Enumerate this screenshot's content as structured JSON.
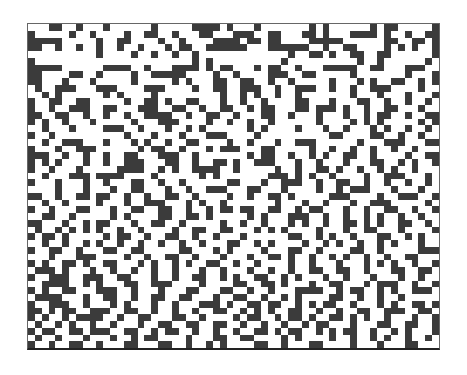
{
  "image": {
    "description": "Abstract noisy binary pixel grid inside a thin frame",
    "colors": {
      "dark": "#3b3b3b",
      "light": "#e9e9e9",
      "background": "#ffffff",
      "frame": "#666666"
    },
    "columns": 60,
    "rows_count": 48,
    "rows": [
      "...##..#...#......#.....####.#...#.......#.#......#.##.....#",
      "#.....#..#....#..##..#...##...###..##...##.#...####.#..#..##",
      "#####.....#..##....#..#....####.##.##....#####......##..##.#",
      "##..#..#..#..#..#...#.##..######...######..#..##....#.#.#..#",
      "..........#....#..#..#..#.............#..##.#..##..##......#",
      "#.......................#.#..........#..........#..#......#.",
      "#####......####..#...####.#.##...#.##..#...#####..##...###..",
      "##....##..#....#..#####....#..#....###..##.....#.......#...#",
      "##...#...#.....#.....#.#...##..##..#..#.....#...#.#..##..#.#",
      ".#..###...###....###....#..##..###..#..###..#..#..###....#..",
      "..#.#......#.#....#.........#..#.#..#..#.......#...#...#...#",
      "#..##..##.....#..##.#..##...#..#..#....##...#...##..#..#..#.",
      "#..#..###..##...###..##..#..##..#.##...##.###.#..#..##...#..",
      "##..##..#..#..#..####..#..##..#...##..#...#...#..#.##..#..##",
      "#.#..#...#.....#...###....#..#..#..#......#....#.#.#.....#.#",
      "..#...#....###..#...#..#.#......#.#....#...#..#...#.#..#..#.",
      "#..#..........#...#...#...###....#..........##....##..#..#..",
      "..#..###...#...#.#..#..##....#..#...#..###......#...###...##",
      "#...#..###......#.##..#...#.###...##.....#..#..#..#..#..#...",
      "###..#..#..#..##...###..#.......#.##..#..#.#..##..#....#..##",
      "#.#.#...#..#..###...##..#..##.#..###...#..#...#...##..#.#..#",
      "#..#...#.....####..#.#..####..#.....#..#..##.#..#..#.#..#...",
      "..#...###.####....#......#.#.......###.#.#..#....#..###...#.",
      "#...#...#..#...##..#..#......##...#..###..#..##..#..#..#..#.",
      "....#...#...#..##...#..#..###...##...#....#..#.###...#...#..",
      "##..#..##.##..#..#..##..#....#..#..##.#.....###....#..###..#",
      "..#..#....#...#..###...#.#..#.......#...#..#...#..###.....#.",
      "#..#...##...#..##..##..#..#.##.##..##..#.##...#..#..##..#..#",
      "..##..#.....#.#....##..##.#.....#.#...###..#..#..#.#..#..#..",
      "##...#..#.##...#..##..#.....#..#..#...#.#..#..##.#.#..##..#.",
      ".#..#.#.#.#..#..#....#..##..##...#.#.#....#...#..##...#....#",
      "#.##.#.....#.##..#..##..#..#...#......##..#.#..#...##..#.#..",
      "..#..#..#.#..#..#..#..#..#...##..#.#....#..#.#..#..#.#...#..",
      "#..##..#...##..##.....##...#.#....#...##..#....##..#.....###",
      "...#...###....#..#..##..#...#...#..##.#..#..#.#..#..#..##...",
      "#.#..##.#..##...#.#..#.#..##..#..#....#..#...#...#.#.#..#..#",
      ".###.#...#..#..#..#..#...#..#...#..#..#..##..##..#...##..##.",
      "#..###..###..##...#..#..##..#.#..##..#.#...#..#...#...#..#..",
      "..####..#.#...##..###....#....##..##.#...#..##...#.###..#..#",
      "#.#..##...###..#...#...##...##..#..#...####..#.##..#.#..###.",
      ".####...#..##..#..##..##...#..##..#..#.#....##..#..#..#.....",
      "#..###..#...#.#...#..#...###.#..##.##..#.#.##..#...#.#..##.#",
      "##.#.##..###..##..#..#..#..##..#.#.#..##..#..#..##..###..##.",
      "#.#..#.####..#..##...##..#....#.##..#.##.#..##.#.#..#...#..#",
      ".#..#.#..#..#...#..##..##..##..#..#..#..#.##...#...##..##..#",
      "#.##..##.###..##..#.##..#..#..#..##.#.##..#.#.##..#..#.#...#",
      ".#..#...#...#..#.##....#...##..##....#.#....#..#..#.#..#..#.",
      "#..#..##..#...##...##..#..#.#....##..#...##....#...#...##..."
    ]
  }
}
